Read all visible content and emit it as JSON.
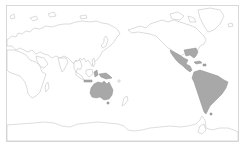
{
  "map": {
    "projection": "pacific-centered equirectangular",
    "background_color": "#ffffff",
    "outline_color": "#c4c4c4",
    "highlight_color": "#a8a8a8",
    "frame_color": "#d0d0d0",
    "highlighted_regions": [
      "Australia",
      "New Guinea",
      "Eastern Indonesia",
      "Southeastern United States",
      "Mexico",
      "Central America",
      "Caribbean",
      "South America"
    ]
  }
}
